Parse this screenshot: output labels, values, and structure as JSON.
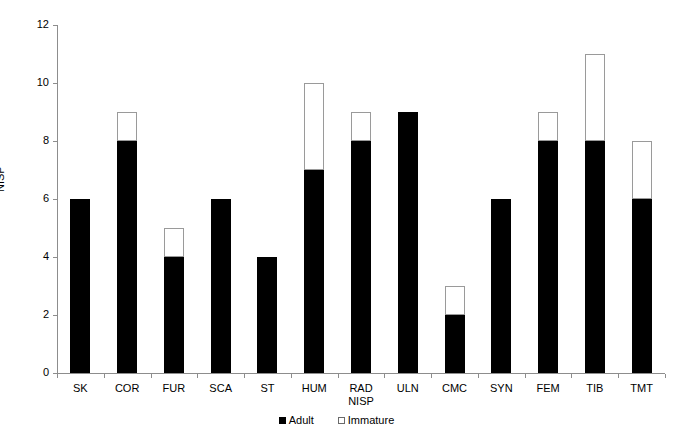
{
  "chart_data": {
    "type": "bar",
    "stacked": true,
    "title": "",
    "xlabel": "NISP",
    "ylabel": "NISP",
    "ylim": [
      0,
      12
    ],
    "yticks": [
      0,
      2,
      4,
      6,
      8,
      10,
      12
    ],
    "grid": false,
    "legend_position": "bottom-center",
    "categories": [
      "SK",
      "COR",
      "FUR",
      "SCA",
      "ST",
      "HUM",
      "RAD",
      "ULN",
      "CMC",
      "SYN",
      "FEM",
      "TIB",
      "TMT"
    ],
    "series": [
      {
        "name": "Adult",
        "color": "#000000",
        "values": [
          6,
          8,
          4,
          6,
          4,
          7,
          8,
          9,
          2,
          6,
          8,
          8,
          6
        ]
      },
      {
        "name": "Immature",
        "color": "#ffffff",
        "values": [
          0,
          1,
          1,
          0,
          0,
          3,
          1,
          0,
          1,
          0,
          1,
          3,
          2
        ]
      }
    ],
    "totals": [
      6,
      9,
      5,
      6,
      4,
      10,
      9,
      9,
      3,
      6,
      9,
      11,
      8
    ]
  },
  "axes": {
    "y_title": "NISP",
    "y_tick_labels": [
      "0",
      "2",
      "4",
      "6",
      "8",
      "10",
      "12"
    ],
    "x_tick_labels": [
      {
        "label": "SK",
        "sub": ""
      },
      {
        "label": "COR",
        "sub": ""
      },
      {
        "label": "FUR",
        "sub": ""
      },
      {
        "label": "SCA",
        "sub": ""
      },
      {
        "label": "ST",
        "sub": ""
      },
      {
        "label": "HUM",
        "sub": ""
      },
      {
        "label": "RAD",
        "sub": "NISP"
      },
      {
        "label": "ULN",
        "sub": ""
      },
      {
        "label": "CMC",
        "sub": ""
      },
      {
        "label": "SYN",
        "sub": ""
      },
      {
        "label": "FEM",
        "sub": ""
      },
      {
        "label": "TIB",
        "sub": ""
      },
      {
        "label": "TMT",
        "sub": ""
      }
    ]
  },
  "legend": {
    "entries": [
      {
        "label": "Adult",
        "swatch": "filled-square"
      },
      {
        "label": "Immature",
        "swatch": "empty-square"
      }
    ]
  }
}
